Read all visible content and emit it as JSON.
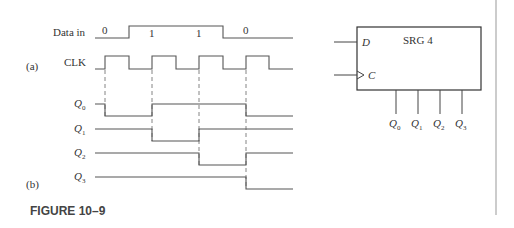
{
  "figure": {
    "caption": "FIGURE 10–9",
    "part_a_label": "(a)",
    "part_b_label": "(b)"
  },
  "timing": {
    "data_in_label": "Data in",
    "clk_label": "CLK",
    "data_bits": [
      "0",
      "1",
      "1",
      "0"
    ],
    "q_labels": [
      {
        "base": "Q",
        "sub": "0"
      },
      {
        "base": "Q",
        "sub": "1"
      },
      {
        "base": "Q",
        "sub": "2"
      },
      {
        "base": "Q",
        "sub": "3"
      }
    ],
    "clock_edges_x": [
      105,
      152,
      199,
      246
    ]
  },
  "block": {
    "title": "SRG 4",
    "input_d": "D",
    "input_c": "C",
    "outputs": [
      {
        "base": "Q",
        "sub": "0"
      },
      {
        "base": "Q",
        "sub": "1"
      },
      {
        "base": "Q",
        "sub": "2"
      },
      {
        "base": "Q",
        "sub": "3"
      }
    ]
  }
}
